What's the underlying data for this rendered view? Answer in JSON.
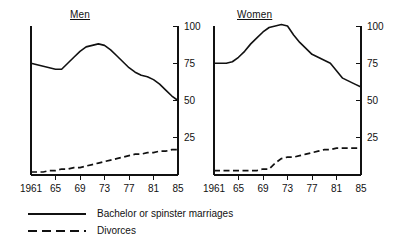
{
  "figure": {
    "panels": [
      {
        "key": "men",
        "title": "Men"
      },
      {
        "key": "women",
        "title": "Women"
      }
    ],
    "legend": [
      {
        "key": "solid-line-key",
        "style": "solid",
        "label": "Bachelor or spinster marriages"
      },
      {
        "key": "dashed-line-key",
        "style": "dashed",
        "label": "Divorces"
      }
    ],
    "line_color": "#111111",
    "background_color": "#ffffff"
  },
  "chart_data": [
    {
      "type": "line",
      "title": "Men",
      "xlabel": "",
      "ylabel": "",
      "xlim": [
        1961,
        1985
      ],
      "ylim": [
        0,
        100
      ],
      "xticks": [
        1961,
        1965,
        1969,
        1973,
        1977,
        1981,
        1985
      ],
      "xticklabels": [
        "1961",
        "65",
        "69",
        "73",
        "77",
        "81",
        "85"
      ],
      "yticks": [
        25,
        50,
        75,
        100
      ],
      "yticklabels": [
        "25",
        "50",
        "75",
        "100"
      ],
      "yaxis_position": "right",
      "grid": false,
      "legend_position": "below-figure",
      "x": [
        1961,
        1962,
        1963,
        1964,
        1965,
        1966,
        1967,
        1968,
        1969,
        1970,
        1971,
        1972,
        1973,
        1974,
        1975,
        1976,
        1977,
        1978,
        1979,
        1980,
        1981,
        1982,
        1983,
        1984,
        1985
      ],
      "series": [
        {
          "name": "Bachelor or spinster marriages",
          "style": "solid",
          "values": [
            75,
            74,
            73,
            72,
            71,
            71,
            75,
            79,
            83,
            86,
            87,
            88,
            87,
            84,
            80,
            76,
            72,
            69,
            67,
            66,
            64,
            61,
            57,
            53,
            50
          ]
        },
        {
          "name": "Divorces",
          "style": "dashed",
          "values": [
            2,
            2,
            2,
            3,
            3,
            4,
            4,
            5,
            5,
            6,
            7,
            8,
            9,
            10,
            11,
            12,
            13,
            14,
            14,
            15,
            15,
            16,
            16,
            17,
            17
          ]
        }
      ]
    },
    {
      "type": "line",
      "title": "Women",
      "xlabel": "",
      "ylabel": "",
      "xlim": [
        1961,
        1985
      ],
      "ylim": [
        0,
        100
      ],
      "xticks": [
        1961,
        1965,
        1969,
        1973,
        1977,
        1981,
        1985
      ],
      "xticklabels": [
        "1961",
        "65",
        "69",
        "73",
        "77",
        "81",
        "85"
      ],
      "yticks": [
        25,
        50,
        75,
        100
      ],
      "yticklabels": [
        "25",
        "50",
        "75",
        "100"
      ],
      "yaxis_position": "right",
      "grid": false,
      "legend_position": "below-figure",
      "x": [
        1961,
        1962,
        1963,
        1964,
        1965,
        1966,
        1967,
        1968,
        1969,
        1970,
        1971,
        1972,
        1973,
        1974,
        1975,
        1976,
        1977,
        1978,
        1979,
        1980,
        1981,
        1982,
        1983,
        1984,
        1985
      ],
      "series": [
        {
          "name": "Bachelor or spinster marriages",
          "style": "solid",
          "values": [
            75,
            75,
            75,
            76,
            79,
            83,
            88,
            92,
            96,
            99,
            100,
            101,
            100,
            94,
            89,
            85,
            81,
            79,
            77,
            75,
            70,
            65,
            63,
            61,
            59
          ]
        },
        {
          "name": "Divorces",
          "style": "dashed",
          "values": [
            3,
            3,
            3,
            3,
            3,
            3,
            3,
            3,
            4,
            4,
            8,
            11,
            12,
            12,
            13,
            14,
            15,
            16,
            17,
            17,
            18,
            18,
            18,
            18,
            18
          ]
        }
      ]
    }
  ]
}
